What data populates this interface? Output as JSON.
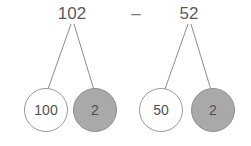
{
  "diagram": {
    "type": "number-bond-decomposition",
    "operator": {
      "symbol": "–",
      "name": "minus-sign"
    },
    "groups": [
      {
        "id": "minuend-group",
        "total": "102",
        "parts": [
          {
            "value": "100",
            "style": "open"
          },
          {
            "value": "2",
            "style": "filled"
          }
        ]
      },
      {
        "id": "subtrahend-group",
        "total": "52",
        "parts": [
          {
            "value": "50",
            "style": "open"
          },
          {
            "value": "2",
            "style": "filled"
          }
        ]
      }
    ],
    "colors": {
      "background": "#ffffff",
      "filled_node_fill": "#a9a9a9",
      "open_node_fill": "#ffffff",
      "stroke": "#9a9a9a",
      "line": "#8d8d8d",
      "text": "#5b5b5b"
    }
  }
}
